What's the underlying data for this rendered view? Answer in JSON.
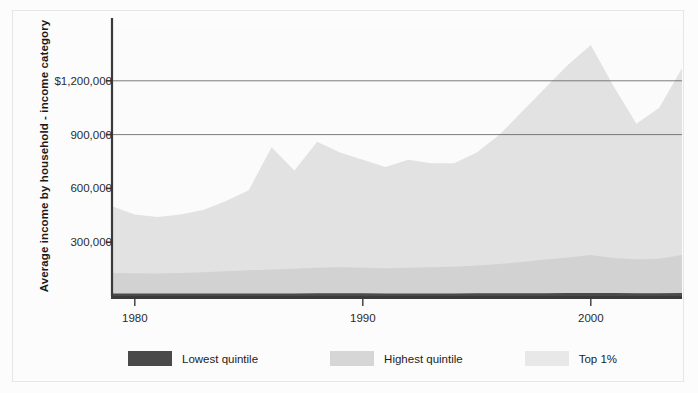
{
  "chart_data": {
    "type": "area",
    "stacked": false,
    "title": "",
    "xlabel": "",
    "ylabel": "Average income by household - income category",
    "xlim": [
      1979,
      2004
    ],
    "ylim": [
      0,
      1500000
    ],
    "grid": "horizontal-partial",
    "y_ticks": [
      300000,
      600000,
      900000,
      1200000
    ],
    "y_tick_labels": [
      "300,000",
      "600,000",
      "900,000",
      "$1,200,000"
    ],
    "x_ticks": [
      1980,
      1990,
      2000
    ],
    "x_tick_labels": [
      "1980",
      "1990",
      "2000"
    ],
    "gridline_values": [
      900000,
      1200000
    ],
    "legend_position": "bottom-left",
    "x": [
      1979,
      1980,
      1981,
      1982,
      1983,
      1984,
      1985,
      1986,
      1987,
      1988,
      1989,
      1990,
      1991,
      1992,
      1993,
      1994,
      1995,
      1996,
      1997,
      1998,
      1999,
      2000,
      2001,
      2002,
      2003,
      2004
    ],
    "series": [
      {
        "name": "Top 1%",
        "color": "#e2e2e2",
        "values": [
          500000,
          455000,
          440000,
          455000,
          480000,
          530000,
          590000,
          830000,
          700000,
          860000,
          800000,
          760000,
          720000,
          760000,
          740000,
          740000,
          800000,
          900000,
          1030000,
          1160000,
          1290000,
          1400000,
          1170000,
          960000,
          1050000,
          1270000
        ]
      },
      {
        "name": "Highest quintile",
        "color": "#d2d2d2",
        "values": [
          128000,
          127000,
          126000,
          128000,
          132000,
          138000,
          143000,
          148000,
          152000,
          158000,
          160000,
          158000,
          155000,
          158000,
          160000,
          163000,
          170000,
          178000,
          190000,
          203000,
          215000,
          228000,
          212000,
          205000,
          208000,
          228000
        ]
      },
      {
        "name": "Lowest quintile",
        "color": "#4a4a4a",
        "values": [
          14000,
          14000,
          13500,
          13500,
          13500,
          14000,
          14000,
          14500,
          14500,
          15000,
          15000,
          15000,
          14500,
          14500,
          14500,
          14500,
          15000,
          15000,
          15500,
          16000,
          16500,
          17000,
          16500,
          16000,
          16000,
          16500
        ]
      }
    ]
  },
  "legend": {
    "items": [
      {
        "label": "Lowest quintile",
        "color": "#4a4a4a"
      },
      {
        "label": "Highest quintile",
        "color": "#d6d6d6"
      },
      {
        "label": "Top 1%",
        "color": "#e8e8e8"
      }
    ]
  },
  "axis": {
    "y_title": "Average income by household - income category"
  }
}
